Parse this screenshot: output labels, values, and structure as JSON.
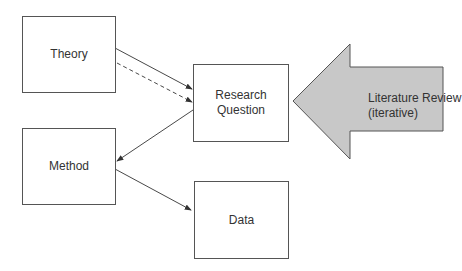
{
  "nodes": {
    "theory": {
      "label": "Theory"
    },
    "research_question": {
      "line1": "Research",
      "line2": "Question"
    },
    "method": {
      "label": "Method"
    },
    "data": {
      "label": "Data"
    }
  },
  "literature_arrow": {
    "line1": "Literature Review",
    "line2": "(iterative)",
    "fill": "#c8c8c8"
  },
  "edges": [
    {
      "from": "Theory",
      "to": "Research Question",
      "style": "solid"
    },
    {
      "from": "Theory",
      "to": "Research Question",
      "style": "dashed"
    },
    {
      "from": "Research Question",
      "to": "Method",
      "style": "solid"
    },
    {
      "from": "Method",
      "to": "Data",
      "style": "solid"
    }
  ]
}
